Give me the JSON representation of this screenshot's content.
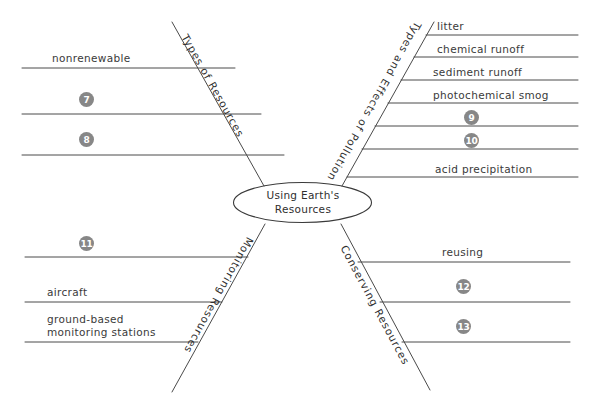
{
  "diagram": {
    "type": "fishbone-concept-map",
    "center": {
      "title": "Using Earth's\nResources"
    },
    "branches": [
      {
        "id": "types-of-resources",
        "spine_label": "Types of Resources",
        "position": "top-left",
        "items": [
          {
            "kind": "text",
            "text": "nonrenewable"
          },
          {
            "kind": "badge",
            "text": "7"
          },
          {
            "kind": "badge",
            "text": "8"
          }
        ]
      },
      {
        "id": "types-and-effects-of-pollution",
        "spine_label": "Types and Effects of Pollution",
        "position": "top-right",
        "items": [
          {
            "kind": "text",
            "text": "litter"
          },
          {
            "kind": "text",
            "text": "chemical runoff"
          },
          {
            "kind": "text",
            "text": "sediment runoff"
          },
          {
            "kind": "text",
            "text": "photochemical smog"
          },
          {
            "kind": "badge",
            "text": "9"
          },
          {
            "kind": "badge",
            "text": "10"
          },
          {
            "kind": "text",
            "text": "acid precipitation"
          }
        ]
      },
      {
        "id": "monitoring-resources",
        "spine_label": "Monitoring Resources",
        "position": "bottom-left",
        "items": [
          {
            "kind": "badge",
            "text": "11"
          },
          {
            "kind": "text",
            "text": "aircraft"
          },
          {
            "kind": "text",
            "text": "ground-based\nmonitoring stations"
          }
        ]
      },
      {
        "id": "conserving-resources",
        "spine_label": "Conserving Resources",
        "position": "bottom-right",
        "items": [
          {
            "kind": "text",
            "text": "reusing"
          },
          {
            "kind": "badge",
            "text": "12"
          },
          {
            "kind": "badge",
            "text": "13"
          }
        ]
      }
    ],
    "colors": {
      "line": "#4a4a4a",
      "badge_fill": "#878787",
      "badge_text": "#ffffff",
      "text": "#2f2f2f",
      "background": "#ffffff"
    }
  }
}
